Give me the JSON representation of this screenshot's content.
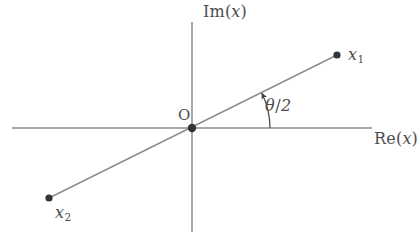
{
  "figure": {
    "type": "complex-plane-diagram",
    "width": 419,
    "height": 240,
    "background_color": "#ffffff",
    "line_color": "#808080",
    "text_color": "#4d4d4d",
    "point_color": "#333333"
  },
  "axes": {
    "imaginary": {
      "label_prefix": "Im",
      "label_open": "(",
      "label_variable": "x",
      "label_close": ")",
      "label_text": "Im(x)",
      "x": 192,
      "y_top": 22,
      "y_bottom": 232
    },
    "real": {
      "label_prefix": "Re",
      "label_open": "(",
      "label_variable": "x",
      "label_close": ")",
      "label_text": "Re(x)",
      "y": 128,
      "x_left": 12,
      "x_right": 372
    }
  },
  "origin": {
    "label": "O",
    "x": 192,
    "y": 128,
    "dot_radius": 4.2
  },
  "points": [
    {
      "name": "x1",
      "label_variable": "x",
      "label_subscript": "1",
      "label_text": "x₁",
      "x": 337,
      "y": 55,
      "dot_radius": 3.6
    },
    {
      "name": "x2",
      "label_variable": "x",
      "label_subscript": "2",
      "label_text": "x₂",
      "x": 49,
      "y": 198,
      "dot_radius": 3.6
    }
  ],
  "ray": {
    "description": "straight line through origin joining x2 and x1",
    "from_x": 49,
    "from_y": 198,
    "to_x": 337,
    "to_y": 55,
    "angle_degrees": 26.4
  },
  "angle_arc": {
    "label_symbol": "θ",
    "label_separator": "/",
    "label_denominator": "2",
    "label_text": "θ/2",
    "center_x": 192,
    "center_y": 128,
    "radius": 78,
    "start_degrees": 0,
    "end_degrees": 26.4,
    "arrow_at": "end",
    "direction": "counterclockwise"
  }
}
